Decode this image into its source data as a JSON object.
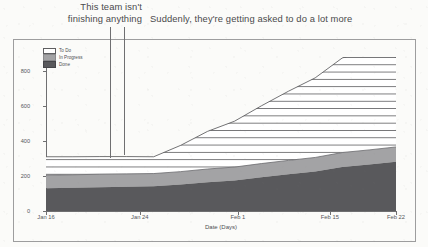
{
  "annotations": [
    {
      "id": "team-not-finishing",
      "text": "This team isn't\nfinishing anything",
      "line1": "This team isn't",
      "line2": "finishing anything"
    },
    {
      "id": "asked-to-do-more",
      "text": "Suddenly, they're getting asked to do a lot more"
    }
  ],
  "legend": {
    "items": [
      {
        "label": "To Do",
        "color": "#ffffff",
        "pattern": "horizontal-hatch"
      },
      {
        "label": "In Progress",
        "color": "#a3a3a5",
        "pattern": "solid"
      },
      {
        "label": "Done",
        "color": "#59595c",
        "pattern": "solid"
      }
    ]
  },
  "chart_data": {
    "type": "area",
    "stacked": true,
    "title": "",
    "xlabel": "Date (Days)",
    "ylabel": "Number of Issues",
    "grid": false,
    "legend_position": "top-left-inside",
    "ylim": [
      0,
      880
    ],
    "yticks": [
      0,
      200,
      400,
      600,
      800
    ],
    "xtick_labels": [
      "Jan 16",
      "Jan 24",
      "Feb 1",
      "Feb 15",
      "Feb 22"
    ],
    "xtick_positions_frac": [
      0.0,
      0.268,
      0.548,
      0.811,
      1.0
    ],
    "x": [
      "Jan 16",
      "Jan 18",
      "Jan 20",
      "Jan 22",
      "Jan 24",
      "Jan 27",
      "Jan 30",
      "Feb 1",
      "Feb 4",
      "Feb 7",
      "Feb 10",
      "Feb 15",
      "Feb 18",
      "Feb 22"
    ],
    "series": [
      {
        "name": "Done",
        "color": "#59595c",
        "values": [
          130,
          133,
          136,
          139,
          142,
          152,
          165,
          175,
          193,
          210,
          226,
          252,
          266,
          282
        ]
      },
      {
        "name": "In Progress",
        "color": "#a3a3a5",
        "values": [
          75,
          74,
          74,
          73,
          72,
          73,
          75,
          76,
          78,
          79,
          80,
          82,
          83,
          84
        ]
      },
      {
        "name": "To Do",
        "color": "#ffffff",
        "values": [
          105,
          103,
          101,
          99,
          96,
          150,
          215,
          262,
          330,
          395,
          455,
          540,
          576,
          514
        ]
      }
    ],
    "totals": [
      310,
      310,
      311,
      311,
      310,
      375,
      455,
      513,
      601,
      684,
      761,
      874,
      925,
      880
    ],
    "annotation_lines_x_frac": [
      0.183,
      0.223
    ]
  }
}
